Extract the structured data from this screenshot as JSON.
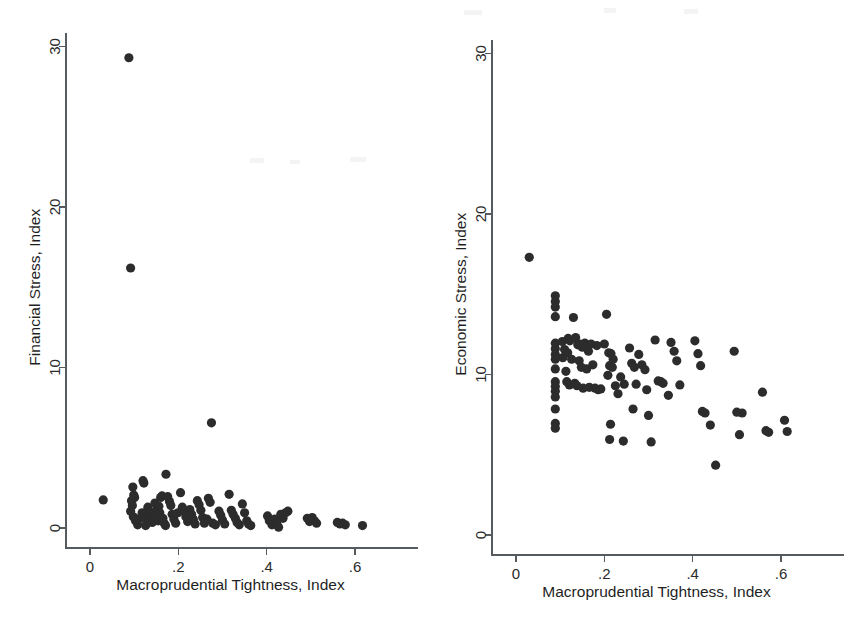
{
  "figure": {
    "background_color": "#ffffff",
    "marker_color": "#2c2c2c",
    "axis_color": "#555b5e",
    "panel_count": 2
  },
  "chart_data": [
    {
      "type": "scatter",
      "title": "",
      "panel_name": "financial-stress",
      "xlabel": "Macroprudential Tightness, Index",
      "ylabel": "Financial Stress, Index",
      "xlim": [
        -0.02,
        0.66
      ],
      "ylim": [
        -1.2,
        31.5
      ],
      "xticks": [
        0,
        0.2,
        0.4,
        0.6
      ],
      "xticklabels": [
        "0",
        ".2",
        ".4",
        ".6"
      ],
      "yticks": [
        0,
        10,
        20,
        30
      ],
      "yticklabels": [
        "0",
        "10",
        "20",
        "30"
      ],
      "grid": false,
      "legend": "none",
      "marker": "filled-circle",
      "n_points": 97,
      "points": [
        [
          0.03,
          1.75
        ],
        [
          0.088,
          29.3
        ],
        [
          0.092,
          16.2
        ],
        [
          0.275,
          6.55
        ],
        [
          0.172,
          3.35
        ],
        [
          0.12,
          2.95
        ],
        [
          0.122,
          2.8
        ],
        [
          0.097,
          2.55
        ],
        [
          0.099,
          2.05
        ],
        [
          0.101,
          1.9
        ],
        [
          0.094,
          1.7
        ],
        [
          0.096,
          1.4
        ],
        [
          0.092,
          1.05
        ],
        [
          0.098,
          0.7
        ],
        [
          0.103,
          0.45
        ],
        [
          0.108,
          0.2
        ],
        [
          0.131,
          1.3
        ],
        [
          0.134,
          1.05
        ],
        [
          0.137,
          0.8
        ],
        [
          0.129,
          0.55
        ],
        [
          0.141,
          0.35
        ],
        [
          0.126,
          0.15
        ],
        [
          0.147,
          1.55
        ],
        [
          0.152,
          1.2
        ],
        [
          0.156,
          1.35
        ],
        [
          0.16,
          1.9
        ],
        [
          0.163,
          2.0
        ],
        [
          0.158,
          0.95
        ],
        [
          0.15,
          0.7
        ],
        [
          0.154,
          0.45
        ],
        [
          0.165,
          0.6
        ],
        [
          0.168,
          0.3
        ],
        [
          0.171,
          0.15
        ],
        [
          0.176,
          1.95
        ],
        [
          0.18,
          1.65
        ],
        [
          0.183,
          1.4
        ],
        [
          0.186,
          0.85
        ],
        [
          0.19,
          0.55
        ],
        [
          0.194,
          0.3
        ],
        [
          0.205,
          2.2
        ],
        [
          0.209,
          1.3
        ],
        [
          0.213,
          1.05
        ],
        [
          0.217,
          0.7
        ],
        [
          0.221,
          0.4
        ],
        [
          0.226,
          1.15
        ],
        [
          0.23,
          0.85
        ],
        [
          0.234,
          0.55
        ],
        [
          0.238,
          0.25
        ],
        [
          0.243,
          1.7
        ],
        [
          0.247,
          1.45
        ],
        [
          0.251,
          1.1
        ],
        [
          0.255,
          0.65
        ],
        [
          0.259,
          0.3
        ],
        [
          0.268,
          1.85
        ],
        [
          0.272,
          1.6
        ],
        [
          0.265,
          0.55
        ],
        [
          0.278,
          0.3
        ],
        [
          0.284,
          0.2
        ],
        [
          0.292,
          1.05
        ],
        [
          0.296,
          0.8
        ],
        [
          0.3,
          0.5
        ],
        [
          0.305,
          0.25
        ],
        [
          0.315,
          2.1
        ],
        [
          0.32,
          1.1
        ],
        [
          0.324,
          0.85
        ],
        [
          0.329,
          0.6
        ],
        [
          0.333,
          0.35
        ],
        [
          0.338,
          0.2
        ],
        [
          0.345,
          1.5
        ],
        [
          0.35,
          0.95
        ],
        [
          0.355,
          0.45
        ],
        [
          0.359,
          0.25
        ],
        [
          0.364,
          0.15
        ],
        [
          0.402,
          0.75
        ],
        [
          0.406,
          0.45
        ],
        [
          0.412,
          0.2
        ],
        [
          0.418,
          0.55
        ],
        [
          0.423,
          0.25
        ],
        [
          0.427,
          0.05
        ],
        [
          0.432,
          0.85
        ],
        [
          0.437,
          0.6
        ],
        [
          0.443,
          0.95
        ],
        [
          0.448,
          1.05
        ],
        [
          0.492,
          0.6
        ],
        [
          0.497,
          0.4
        ],
        [
          0.503,
          0.65
        ],
        [
          0.508,
          0.45
        ],
        [
          0.513,
          0.3
        ],
        [
          0.56,
          0.35
        ],
        [
          0.566,
          0.25
        ],
        [
          0.572,
          0.3
        ],
        [
          0.578,
          0.2
        ],
        [
          0.617,
          0.15
        ],
        [
          0.118,
          0.95
        ],
        [
          0.113,
          0.6
        ],
        [
          0.145,
          0.95
        ],
        [
          0.199,
          0.95
        ]
      ]
    },
    {
      "type": "scatter",
      "title": "",
      "panel_name": "economic-stress",
      "xlabel": "Macroprudential Tightness, Index",
      "ylabel": "Economic Stress, Index",
      "xlim": [
        -0.02,
        0.66
      ],
      "ylim": [
        -1.2,
        31.5
      ],
      "xticks": [
        0,
        0.2,
        0.4,
        0.6
      ],
      "xticklabels": [
        "0",
        ".2",
        ".4",
        ".6"
      ],
      "yticks": [
        0,
        10,
        20,
        30
      ],
      "yticklabels": [
        "0",
        "10",
        "20",
        "30"
      ],
      "grid": false,
      "legend": "none",
      "marker": "filled-circle",
      "n_points": 98,
      "points": [
        [
          0.03,
          17.3
        ],
        [
          0.089,
          14.9
        ],
        [
          0.089,
          14.55
        ],
        [
          0.089,
          14.2
        ],
        [
          0.089,
          13.6
        ],
        [
          0.13,
          13.55
        ],
        [
          0.089,
          11.95
        ],
        [
          0.089,
          11.6
        ],
        [
          0.089,
          11.25
        ],
        [
          0.089,
          10.95
        ],
        [
          0.089,
          10.35
        ],
        [
          0.089,
          9.55
        ],
        [
          0.089,
          9.25
        ],
        [
          0.089,
          8.95
        ],
        [
          0.089,
          8.6
        ],
        [
          0.089,
          7.85
        ],
        [
          0.089,
          6.95
        ],
        [
          0.089,
          6.65
        ],
        [
          0.105,
          12.05
        ],
        [
          0.11,
          11.55
        ],
        [
          0.106,
          11.05
        ],
        [
          0.118,
          12.25
        ],
        [
          0.122,
          12.1
        ],
        [
          0.117,
          11.35
        ],
        [
          0.126,
          10.95
        ],
        [
          0.113,
          10.2
        ],
        [
          0.115,
          9.55
        ],
        [
          0.121,
          9.35
        ],
        [
          0.135,
          12.3
        ],
        [
          0.14,
          11.85
        ],
        [
          0.145,
          11.9
        ],
        [
          0.15,
          11.7
        ],
        [
          0.156,
          11.95
        ],
        [
          0.143,
          10.85
        ],
        [
          0.148,
          10.45
        ],
        [
          0.16,
          10.35
        ],
        [
          0.133,
          9.45
        ],
        [
          0.138,
          9.3
        ],
        [
          0.152,
          9.15
        ],
        [
          0.166,
          9.2
        ],
        [
          0.174,
          10.6
        ],
        [
          0.179,
          9.15
        ],
        [
          0.186,
          9.05
        ],
        [
          0.192,
          9.1
        ],
        [
          0.205,
          13.75
        ],
        [
          0.2,
          11.9
        ],
        [
          0.21,
          11.35
        ],
        [
          0.215,
          11.3
        ],
        [
          0.22,
          10.95
        ],
        [
          0.212,
          10.55
        ],
        [
          0.218,
          10.45
        ],
        [
          0.208,
          9.95
        ],
        [
          0.214,
          6.9
        ],
        [
          0.212,
          5.95
        ],
        [
          0.243,
          5.85
        ],
        [
          0.237,
          9.85
        ],
        [
          0.245,
          9.4
        ],
        [
          0.257,
          11.65
        ],
        [
          0.262,
          10.7
        ],
        [
          0.268,
          10.45
        ],
        [
          0.272,
          9.4
        ],
        [
          0.265,
          7.85
        ],
        [
          0.278,
          11.25
        ],
        [
          0.285,
          10.6
        ],
        [
          0.292,
          10.3
        ],
        [
          0.296,
          9.05
        ],
        [
          0.3,
          7.45
        ],
        [
          0.306,
          5.8
        ],
        [
          0.315,
          12.15
        ],
        [
          0.322,
          9.6
        ],
        [
          0.328,
          9.55
        ],
        [
          0.333,
          9.45
        ],
        [
          0.345,
          8.7
        ],
        [
          0.351,
          12.0
        ],
        [
          0.358,
          11.45
        ],
        [
          0.364,
          10.85
        ],
        [
          0.371,
          9.35
        ],
        [
          0.405,
          12.1
        ],
        [
          0.412,
          11.3
        ],
        [
          0.418,
          10.55
        ],
        [
          0.422,
          7.7
        ],
        [
          0.428,
          7.6
        ],
        [
          0.44,
          6.85
        ],
        [
          0.452,
          4.35
        ],
        [
          0.494,
          11.45
        ],
        [
          0.5,
          7.65
        ],
        [
          0.506,
          6.25
        ],
        [
          0.512,
          7.6
        ],
        [
          0.558,
          8.9
        ],
        [
          0.566,
          6.5
        ],
        [
          0.572,
          6.4
        ],
        [
          0.608,
          7.15
        ],
        [
          0.614,
          6.45
        ],
        [
          0.17,
          11.9
        ],
        [
          0.164,
          11.45
        ],
        [
          0.183,
          11.8
        ],
        [
          0.225,
          9.3
        ],
        [
          0.231,
          8.8
        ]
      ]
    }
  ]
}
